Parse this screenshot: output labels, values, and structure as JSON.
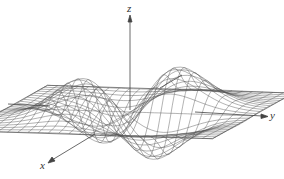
{
  "figure": {
    "axes": {
      "x": {
        "label": "x"
      },
      "y": {
        "label": "y"
      },
      "z": {
        "label": "z"
      }
    },
    "colors": {
      "mesh": "#555555",
      "axis": "#444444",
      "background": "#ffffff"
    },
    "surface": {
      "shape": "two peaks (back) and two troughs (front), saddle-like around origin",
      "grid_lines": 24
    }
  }
}
